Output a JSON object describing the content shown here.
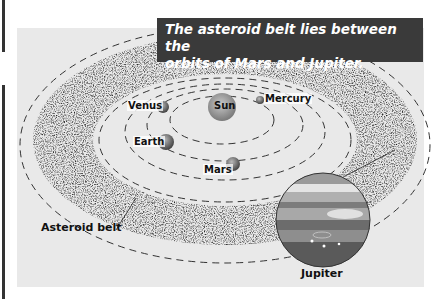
{
  "caption": {
    "line1": "The asteroid belt lies between the",
    "line2": "orbits of Mars and Jupiter."
  },
  "labels": {
    "sun": "Sun",
    "mercury": "Mercury",
    "venus": "Venus",
    "earth": "Earth",
    "mars": "Mars",
    "jupiter": "Jupiter",
    "asteroid_belt": "Asteroid belt"
  },
  "colors": {
    "panel": "#e9e9e9",
    "caption_bg": "#3a3a3a",
    "caption_text": "#ffffff"
  }
}
